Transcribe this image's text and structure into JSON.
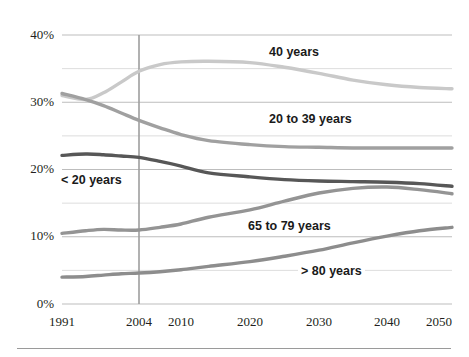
{
  "figure": {
    "background": "#ffffff",
    "footer_rule": true
  },
  "axes": {
    "y_ticks": [
      "0%",
      "10%",
      "20%",
      "30%",
      "40%"
    ],
    "y_tick_values": [
      0,
      10,
      20,
      30,
      40
    ],
    "y_minor_values": [
      5,
      15,
      25,
      35
    ],
    "x_ticks": [
      "1991",
      "2004",
      "2010",
      "2020",
      "2030",
      "2040",
      "2050"
    ],
    "marker_year": "2004",
    "gridline_color": "#c8c8c8",
    "axis_text_color": "#231f20"
  },
  "series_labels": {
    "s40": "40 years",
    "s2039": "20 to 39 years",
    "slt20": "< 20 years",
    "s6579": "65 to 79 years",
    "sgt80": "> 80 years"
  },
  "chart_data": {
    "type": "line",
    "title": "",
    "xlabel": "",
    "ylabel": "",
    "ylim": [
      0,
      40
    ],
    "grid": true,
    "legend": "inline-labels",
    "x": [
      "1991",
      "2004",
      "2010",
      "2020",
      "2030",
      "2040",
      "2050"
    ],
    "x_tick_px": [
      62,
      139,
      181,
      250,
      319,
      387,
      452
    ],
    "series": [
      {
        "name": "40 years",
        "color": "#c9c9c9",
        "label": "40 years",
        "values": [
          31.0,
          34.6,
          36.0,
          35.9,
          34.3,
          32.6,
          32.0
        ],
        "points": [
          [
            1991,
            31.0
          ],
          [
            1995,
            30.4
          ],
          [
            1998,
            31.4
          ],
          [
            2001,
            33.0
          ],
          [
            2004,
            34.6
          ],
          [
            2007,
            35.6
          ],
          [
            2010,
            36.0
          ],
          [
            2014,
            36.1
          ],
          [
            2020,
            35.9
          ],
          [
            2025,
            35.2
          ],
          [
            2030,
            34.3
          ],
          [
            2035,
            33.3
          ],
          [
            2040,
            32.6
          ],
          [
            2045,
            32.2
          ],
          [
            2050,
            32.0
          ]
        ]
      },
      {
        "name": "20 to 39 years",
        "color": "#a0a0a0",
        "label": "20 to 39 years",
        "values": [
          31.3,
          27.3,
          25.2,
          23.7,
          23.3,
          23.2,
          23.2
        ],
        "points": [
          [
            1991,
            31.3
          ],
          [
            1995,
            30.4
          ],
          [
            1998,
            29.5
          ],
          [
            2001,
            28.4
          ],
          [
            2004,
            27.3
          ],
          [
            2007,
            26.2
          ],
          [
            2010,
            25.2
          ],
          [
            2014,
            24.3
          ],
          [
            2020,
            23.7
          ],
          [
            2025,
            23.4
          ],
          [
            2030,
            23.3
          ],
          [
            2035,
            23.2
          ],
          [
            2040,
            23.2
          ],
          [
            2045,
            23.2
          ],
          [
            2050,
            23.2
          ]
        ]
      },
      {
        "name": "< 20 years",
        "color": "#575757",
        "label": "< 20 years",
        "values": [
          22.1,
          21.8,
          20.5,
          18.9,
          18.3,
          18.1,
          17.5
        ],
        "points": [
          [
            1991,
            22.1
          ],
          [
            1995,
            22.3
          ],
          [
            1998,
            22.2
          ],
          [
            2001,
            22.0
          ],
          [
            2004,
            21.8
          ],
          [
            2007,
            21.2
          ],
          [
            2010,
            20.5
          ],
          [
            2014,
            19.5
          ],
          [
            2020,
            18.9
          ],
          [
            2025,
            18.5
          ],
          [
            2030,
            18.3
          ],
          [
            2035,
            18.2
          ],
          [
            2040,
            18.1
          ],
          [
            2045,
            17.9
          ],
          [
            2050,
            17.5
          ]
        ]
      },
      {
        "name": "65 to 79 years",
        "color": "#949494",
        "label": "65 to 79 years",
        "values": [
          10.5,
          11.0,
          11.9,
          14.0,
          16.5,
          17.4,
          16.4
        ],
        "points": [
          [
            1991,
            10.5
          ],
          [
            1995,
            10.9
          ],
          [
            1998,
            11.1
          ],
          [
            2001,
            11.0
          ],
          [
            2004,
            11.0
          ],
          [
            2007,
            11.4
          ],
          [
            2010,
            11.9
          ],
          [
            2014,
            12.9
          ],
          [
            2020,
            14.0
          ],
          [
            2025,
            15.3
          ],
          [
            2030,
            16.5
          ],
          [
            2035,
            17.2
          ],
          [
            2040,
            17.4
          ],
          [
            2045,
            17.0
          ],
          [
            2050,
            16.4
          ]
        ]
      },
      {
        "name": "> 80 years",
        "color": "#8d8d8d",
        "label": "> 80 years",
        "values": [
          4.0,
          4.6,
          5.1,
          6.3,
          8.0,
          10.1,
          11.4
        ],
        "points": [
          [
            1991,
            4.0
          ],
          [
            1995,
            4.1
          ],
          [
            1998,
            4.3
          ],
          [
            2001,
            4.5
          ],
          [
            2004,
            4.6
          ],
          [
            2007,
            4.8
          ],
          [
            2010,
            5.1
          ],
          [
            2014,
            5.6
          ],
          [
            2020,
            6.3
          ],
          [
            2025,
            7.1
          ],
          [
            2030,
            8.0
          ],
          [
            2035,
            9.1
          ],
          [
            2040,
            10.1
          ],
          [
            2045,
            10.9
          ],
          [
            2050,
            11.4
          ]
        ]
      }
    ]
  }
}
